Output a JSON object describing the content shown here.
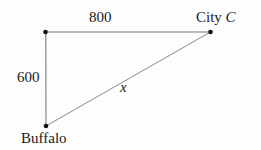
{
  "diagram": {
    "type": "right-triangle-distance-diagram",
    "background_color": "#fdfdfd",
    "line_color": "#7a7a7a",
    "vertex_color": "#111111",
    "text_color": "#1a1a1a",
    "vertices": [
      {
        "name": "corner-vertex",
        "label": "",
        "x": 45.5,
        "y": 32
      },
      {
        "name": "city-c-vertex",
        "label": "City C",
        "x": 210.5,
        "y": 32
      },
      {
        "name": "buffalo-vertex",
        "label": "Buffalo",
        "x": 46,
        "y": 126
      }
    ],
    "edges": [
      {
        "name": "top-edge",
        "label": "800",
        "from": "corner-vertex",
        "to": "city-c-vertex"
      },
      {
        "name": "left-edge",
        "label": "600",
        "from": "corner-vertex",
        "to": "buffalo-vertex"
      },
      {
        "name": "hypotenuse-edge",
        "label": "x",
        "from": "buffalo-vertex",
        "to": "city-c-vertex"
      }
    ],
    "labels": {
      "top_length": "800",
      "left_length": "600",
      "hypotenuse": "x",
      "city_c_prefix": "City ",
      "city_c_letter": "C",
      "buffalo": "Buffalo"
    }
  }
}
